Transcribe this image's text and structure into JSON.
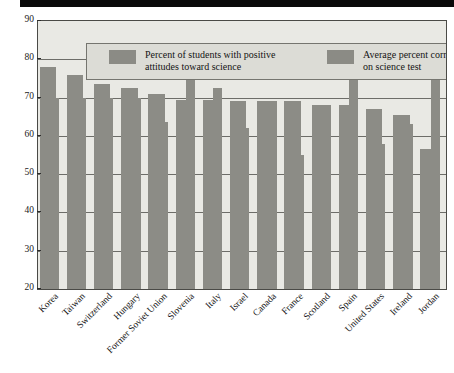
{
  "chart_data": {
    "type": "bar",
    "title": "",
    "xlabel": "",
    "ylabel": "Percent",
    "ylim": [
      20,
      90
    ],
    "ytick_step": 10,
    "yticks": [
      "90",
      "80",
      "70",
      "60",
      "50",
      "40",
      "30",
      "20"
    ],
    "grid": true,
    "legend_position": "top-inside",
    "categories": [
      "Korea",
      "Taiwan",
      "Switzerland",
      "Hungary",
      "Former Soviet Union",
      "Slovenia",
      "Italy",
      "Israel",
      "Canada",
      "France",
      "Scotland",
      "Spain",
      "United States",
      "Ireland",
      "Jordan"
    ],
    "series": [
      {
        "name": "Percent of students with positive attitudes toward science",
        "values": [
          78,
          76,
          73.5,
          72.5,
          71,
          69.5,
          69.5,
          69,
          69,
          69,
          68,
          68,
          67,
          65.5,
          56.5
        ]
      },
      {
        "name": "Average percent correct on science test",
        "values": [
          70,
          70,
          70,
          70,
          63.5,
          78,
          72.5,
          62,
          69,
          55,
          68,
          77.5,
          58,
          63,
          82
        ]
      }
    ]
  },
  "legend": {
    "items": [
      {
        "label": "Percent of students with positive\nattitudes toward science",
        "color": "#8b8b85"
      },
      {
        "label": "Average percent correct\non science test",
        "color": "#8b8b85"
      }
    ]
  },
  "colors": {
    "bar": "#8c8c86",
    "plot_background": "#e9e9e4",
    "legend_background": "#dcdcd6",
    "frame": "#4a4a46",
    "gridline": "#6d6d68",
    "top_rule": "#0a0a0a"
  }
}
